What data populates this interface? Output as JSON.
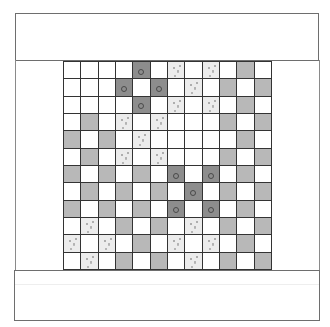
{
  "board": {
    "rows": 12,
    "cols": 12,
    "legend": {
      "W": "empty-white",
      "G": "gray",
      "D": "dark-with-ring",
      "L": "light-speckled"
    },
    "colors": {
      "W": "#ffffff",
      "G": "#b8b8b8",
      "D": "#8d8d8d",
      "L": "#ececec",
      "gridline": "#333333"
    },
    "cells": [
      [
        "W",
        "W",
        "W",
        "W",
        "D",
        "W",
        "L",
        "W",
        "L",
        "W",
        "G",
        "W"
      ],
      [
        "W",
        "W",
        "W",
        "D",
        "W",
        "D",
        "W",
        "L",
        "W",
        "G",
        "W",
        "G"
      ],
      [
        "W",
        "W",
        "W",
        "W",
        "D",
        "W",
        "L",
        "W",
        "L",
        "W",
        "G",
        "W"
      ],
      [
        "W",
        "G",
        "W",
        "L",
        "W",
        "L",
        "W",
        "W",
        "W",
        "G",
        "W",
        "G"
      ],
      [
        "G",
        "W",
        "G",
        "W",
        "L",
        "W",
        "W",
        "W",
        "W",
        "W",
        "G",
        "W"
      ],
      [
        "W",
        "G",
        "W",
        "L",
        "W",
        "L",
        "W",
        "W",
        "W",
        "G",
        "W",
        "G"
      ],
      [
        "G",
        "W",
        "G",
        "W",
        "G",
        "W",
        "D",
        "W",
        "D",
        "W",
        "G",
        "W"
      ],
      [
        "W",
        "G",
        "W",
        "G",
        "W",
        "G",
        "W",
        "D",
        "W",
        "G",
        "W",
        "G"
      ],
      [
        "G",
        "W",
        "G",
        "W",
        "G",
        "W",
        "D",
        "W",
        "D",
        "W",
        "G",
        "W"
      ],
      [
        "W",
        "L",
        "W",
        "G",
        "W",
        "G",
        "W",
        "L",
        "W",
        "G",
        "W",
        "G"
      ],
      [
        "L",
        "W",
        "L",
        "W",
        "G",
        "W",
        "L",
        "W",
        "L",
        "W",
        "G",
        "W"
      ],
      [
        "W",
        "L",
        "W",
        "G",
        "W",
        "G",
        "W",
        "L",
        "W",
        "G",
        "W",
        "G"
      ]
    ]
  },
  "panels": {
    "top": "",
    "bottom": ""
  }
}
